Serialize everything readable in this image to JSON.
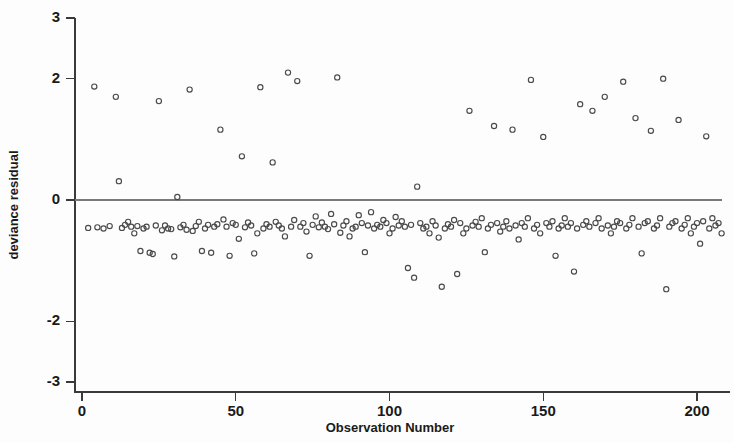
{
  "chart_data": {
    "type": "scatter",
    "title": "",
    "xlabel": "Observation Number",
    "ylabel": "deviance residual",
    "xlim": [
      -3,
      212
    ],
    "ylim": [
      -3,
      3
    ],
    "xticks": [
      0,
      50,
      100,
      150,
      200
    ],
    "xtick_labels": [
      "0",
      "50",
      "100",
      "150",
      "200"
    ],
    "yticks": [
      3,
      2,
      0,
      -2,
      -3
    ],
    "ytick_labels": [
      "3",
      "2",
      "0",
      "-2",
      "-3"
    ],
    "grid": false,
    "legend": null,
    "reference_lines": [
      {
        "name": "zero-line",
        "orientation": "horizontal",
        "y": 0
      }
    ],
    "marker": {
      "style": "open-circle",
      "radius": 2.6,
      "stroke": "#4a4a4a",
      "fill": "none"
    },
    "series": [
      {
        "name": "deviance residual",
        "x": [
          2,
          4,
          5,
          7,
          9,
          11,
          12,
          13,
          14,
          15,
          16,
          17,
          18,
          19,
          20,
          21,
          22,
          23,
          24,
          25,
          26,
          27,
          28,
          29,
          30,
          31,
          32,
          33,
          34,
          35,
          36,
          37,
          38,
          39,
          40,
          41,
          42,
          43,
          44,
          45,
          46,
          47,
          48,
          49,
          50,
          51,
          52,
          53,
          54,
          55,
          56,
          57,
          58,
          59,
          60,
          61,
          62,
          63,
          64,
          65,
          66,
          67,
          68,
          69,
          70,
          71,
          72,
          73,
          74,
          75,
          76,
          77,
          78,
          79,
          80,
          81,
          82,
          83,
          84,
          85,
          86,
          87,
          88,
          89,
          90,
          91,
          92,
          93,
          94,
          95,
          96,
          97,
          98,
          99,
          100,
          101,
          102,
          103,
          104,
          105,
          106,
          107,
          108,
          109,
          110,
          111,
          112,
          113,
          114,
          115,
          116,
          117,
          118,
          119,
          120,
          121,
          122,
          123,
          124,
          125,
          126,
          127,
          128,
          129,
          130,
          131,
          132,
          133,
          134,
          135,
          136,
          137,
          138,
          139,
          140,
          141,
          142,
          143,
          144,
          145,
          146,
          147,
          148,
          149,
          150,
          151,
          152,
          153,
          154,
          155,
          156,
          157,
          158,
          159,
          160,
          161,
          162,
          163,
          164,
          165,
          166,
          167,
          168,
          169,
          170,
          171,
          172,
          173,
          174,
          175,
          176,
          177,
          178,
          179,
          180,
          181,
          182,
          183,
          184,
          185,
          186,
          187,
          188,
          189,
          190,
          191,
          192,
          193,
          194,
          195,
          196,
          197,
          198,
          199,
          200,
          201,
          202,
          203,
          204,
          205,
          206,
          207,
          208
        ],
        "y": [
          -0.46,
          1.87,
          -0.45,
          -0.47,
          -0.43,
          1.7,
          0.31,
          -0.46,
          -0.41,
          -0.36,
          -0.44,
          -0.55,
          -0.43,
          -0.84,
          -0.47,
          -0.44,
          -0.87,
          -0.89,
          -0.42,
          1.63,
          -0.5,
          -0.42,
          -0.47,
          -0.48,
          -0.93,
          0.05,
          -0.45,
          -0.41,
          -0.49,
          1.82,
          -0.51,
          -0.43,
          -0.36,
          -0.84,
          -0.47,
          -0.41,
          -0.87,
          -0.44,
          -0.4,
          1.16,
          -0.32,
          -0.44,
          -0.92,
          -0.38,
          -0.41,
          -0.64,
          0.72,
          -0.45,
          -0.37,
          -0.42,
          -0.88,
          -0.55,
          1.86,
          -0.47,
          -0.4,
          -0.44,
          0.62,
          -0.36,
          -0.42,
          -0.47,
          -0.6,
          2.1,
          -0.44,
          -0.33,
          1.96,
          -0.44,
          -0.38,
          -0.52,
          -0.92,
          -0.41,
          -0.27,
          -0.45,
          -0.37,
          -0.44,
          -0.48,
          -0.23,
          -0.4,
          2.02,
          -0.54,
          -0.42,
          -0.35,
          -0.6,
          -0.47,
          -0.44,
          -0.25,
          -0.38,
          -0.86,
          -0.42,
          -0.2,
          -0.47,
          -0.41,
          -0.44,
          -0.33,
          -0.38,
          -0.55,
          -0.47,
          -0.28,
          -0.42,
          -0.35,
          -0.44,
          -1.12,
          -0.41,
          -1.28,
          0.22,
          -0.38,
          -0.47,
          -0.44,
          -0.55,
          -0.35,
          -0.42,
          -0.62,
          -1.43,
          -0.47,
          -0.4,
          -0.44,
          -0.33,
          -1.22,
          -0.38,
          -0.55,
          -0.47,
          1.47,
          -0.42,
          -0.36,
          -0.44,
          -0.3,
          -0.86,
          -0.47,
          -0.41,
          1.22,
          -0.38,
          -0.52,
          -0.44,
          -0.35,
          -0.47,
          1.16,
          -0.42,
          -0.65,
          -0.38,
          -0.44,
          -0.3,
          1.98,
          -0.47,
          -0.41,
          -0.55,
          1.04,
          -0.38,
          -0.44,
          -0.35,
          -0.92,
          -0.47,
          -0.42,
          -0.3,
          -0.44,
          -0.38,
          -1.18,
          -0.47,
          1.58,
          -0.41,
          -0.35,
          -0.44,
          1.47,
          -0.38,
          -0.3,
          -0.47,
          1.7,
          -0.42,
          -0.55,
          -0.44,
          -0.35,
          -0.38,
          1.95,
          -0.47,
          -0.41,
          -0.3,
          1.35,
          -0.44,
          -0.88,
          -0.38,
          -0.35,
          1.14,
          -0.47,
          -0.42,
          -0.3,
          2.0,
          -1.47,
          -0.44,
          -0.38,
          -0.35,
          1.32,
          -0.47,
          -0.41,
          -0.3,
          -0.55,
          -0.44,
          -0.38,
          -0.72,
          -0.35,
          1.05,
          -0.47,
          -0.3,
          -0.42,
          -0.38,
          -0.55
        ]
      }
    ]
  }
}
